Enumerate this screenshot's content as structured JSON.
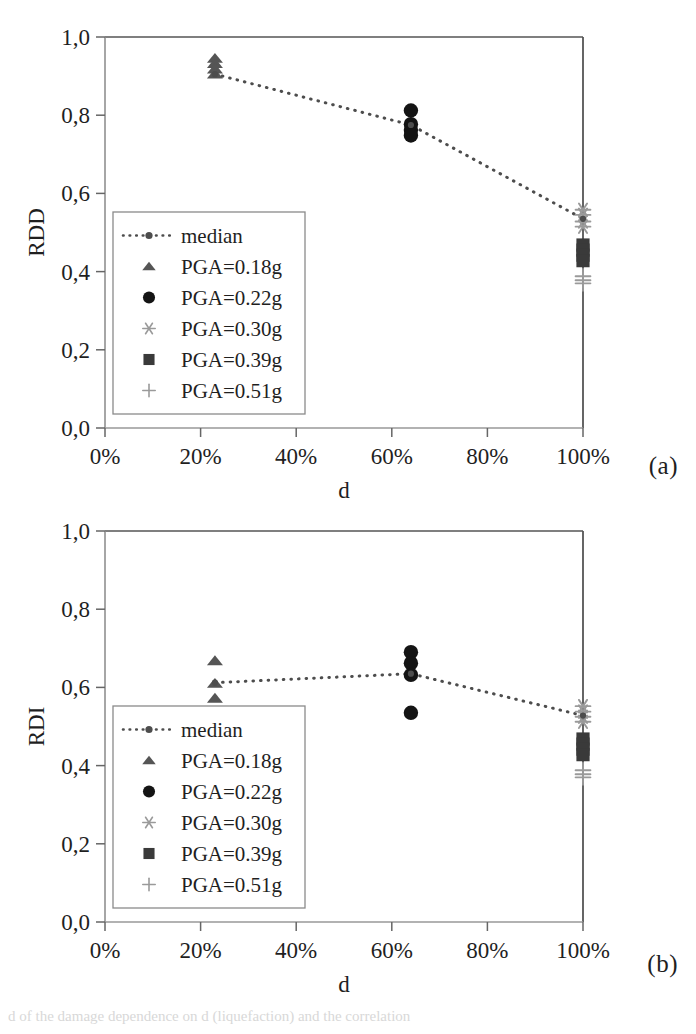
{
  "figure": {
    "panel_a_tag": "(a)",
    "panel_b_tag": "(b)",
    "caption_fragment": "d of the damage dependence on d (liquefaction) and the correlation"
  },
  "legend": {
    "entries": [
      {
        "label": "median",
        "marker": "dotted-line-with-dot",
        "color": "#4d4d4d"
      },
      {
        "label": "PGA=0.18g",
        "marker": "triangle",
        "color": "#555555"
      },
      {
        "label": "PGA=0.22g",
        "marker": "circle",
        "color": "#141414"
      },
      {
        "label": "PGA=0.30g",
        "marker": "star",
        "color": "#9a9a9a"
      },
      {
        "label": "PGA=0.39g",
        "marker": "square",
        "color": "#3a3a3a"
      },
      {
        "label": "PGA=0.51g",
        "marker": "plus",
        "color": "#9a9a9a"
      }
    ]
  },
  "chart_data": [
    {
      "id": "panel-a",
      "type": "scatter",
      "title": "",
      "xlabel": "d",
      "ylabel": "RDD",
      "xlim": [
        0,
        100
      ],
      "ylim": [
        0.0,
        1.0
      ],
      "grid": false,
      "legend_position": "center-left",
      "xticks": [
        "0%",
        "20%",
        "40%",
        "60%",
        "80%",
        "100%"
      ],
      "xtick_values": [
        0,
        20,
        40,
        60,
        80,
        100
      ],
      "yticks": [
        "0,0",
        "0,2",
        "0,4",
        "0,6",
        "0,8",
        "1,0"
      ],
      "ytick_values": [
        0.0,
        0.2,
        0.4,
        0.6,
        0.8,
        1.0
      ],
      "series": [
        {
          "name": "median",
          "marker": "dotted-line-with-dot",
          "color": "#4d4d4d",
          "x": [
            23,
            64,
            100
          ],
          "values": [
            0.905,
            0.775,
            0.535
          ]
        },
        {
          "name": "PGA=0.18g",
          "marker": "triangle",
          "color": "#555555",
          "x": [
            23,
            23,
            23,
            23
          ],
          "values": [
            0.945,
            0.932,
            0.918,
            0.905
          ]
        },
        {
          "name": "PGA=0.22g",
          "marker": "circle",
          "color": "#141414",
          "x": [
            64,
            64,
            64,
            64
          ],
          "values": [
            0.812,
            0.777,
            0.762,
            0.748
          ]
        },
        {
          "name": "PGA=0.30g",
          "marker": "star",
          "color": "#9a9a9a",
          "x": [
            100,
            100,
            100,
            100
          ],
          "values": [
            0.558,
            0.545,
            0.528,
            0.515
          ]
        },
        {
          "name": "PGA=0.39g",
          "marker": "square",
          "color": "#3a3a3a",
          "x": [
            100,
            100,
            100,
            100
          ],
          "values": [
            0.468,
            0.455,
            0.442,
            0.428
          ]
        },
        {
          "name": "PGA=0.51g",
          "marker": "plus",
          "color": "#9a9a9a",
          "x": [
            100,
            100,
            100
          ],
          "values": [
            0.388,
            0.378,
            0.37
          ]
        }
      ]
    },
    {
      "id": "panel-b",
      "type": "scatter",
      "title": "",
      "xlabel": "d",
      "ylabel": "RDI",
      "xlim": [
        0,
        100
      ],
      "ylim": [
        0.0,
        1.0
      ],
      "grid": false,
      "legend_position": "center-left",
      "xticks": [
        "0%",
        "20%",
        "40%",
        "60%",
        "80%",
        "100%"
      ],
      "xtick_values": [
        0,
        20,
        40,
        60,
        80,
        100
      ],
      "yticks": [
        "0,0",
        "0,2",
        "0,4",
        "0,6",
        "0,8",
        "1,0"
      ],
      "ytick_values": [
        0.0,
        0.2,
        0.4,
        0.6,
        0.8,
        1.0
      ],
      "series": [
        {
          "name": "median",
          "marker": "dotted-line-with-dot",
          "color": "#4d4d4d",
          "x": [
            23,
            64,
            100
          ],
          "values": [
            0.612,
            0.635,
            0.528
          ]
        },
        {
          "name": "PGA=0.18g",
          "marker": "triangle",
          "color": "#555555",
          "x": [
            23,
            23,
            23
          ],
          "values": [
            0.668,
            0.61,
            0.572
          ]
        },
        {
          "name": "PGA=0.22g",
          "marker": "circle",
          "color": "#141414",
          "x": [
            64,
            64,
            64,
            64
          ],
          "values": [
            0.69,
            0.662,
            0.632,
            0.535
          ]
        },
        {
          "name": "PGA=0.30g",
          "marker": "star",
          "color": "#9a9a9a",
          "x": [
            100,
            100,
            100,
            100
          ],
          "values": [
            0.552,
            0.538,
            0.525,
            0.512
          ]
        },
        {
          "name": "PGA=0.39g",
          "marker": "square",
          "color": "#3a3a3a",
          "x": [
            100,
            100,
            100,
            100
          ],
          "values": [
            0.468,
            0.455,
            0.442,
            0.428
          ]
        },
        {
          "name": "PGA=0.51g",
          "marker": "plus",
          "color": "#9a9a9a",
          "x": [
            100,
            100,
            100
          ],
          "values": [
            0.388,
            0.378,
            0.37
          ]
        }
      ]
    }
  ]
}
